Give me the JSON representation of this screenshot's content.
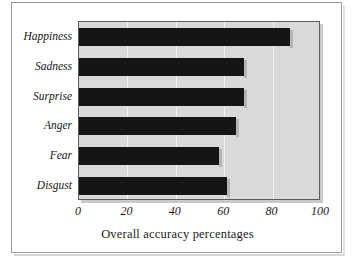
{
  "chart_data": {
    "type": "bar",
    "orientation": "horizontal",
    "title": "",
    "xlabel": "Overall accuracy percentages",
    "ylabel": "",
    "categories": [
      "Happiness",
      "Sadness",
      "Surprise",
      "Anger",
      "Fear",
      "Disgust"
    ],
    "values": [
      87,
      68,
      68,
      65,
      58,
      61
    ],
    "xlim": [
      0,
      100
    ],
    "xticks": [
      0,
      20,
      40,
      60,
      80,
      100
    ],
    "xtick_labels": [
      "0",
      "20",
      "40",
      "60",
      "80",
      "100"
    ],
    "grid": "vertical",
    "legend": "none",
    "series": [
      {
        "name": "Overall accuracy percentages",
        "values": [
          87,
          68,
          68,
          65,
          58,
          61
        ]
      }
    ],
    "colors": {
      "bar": "#151515",
      "plot_background": "#d9d9d9",
      "gridline": "#f2f2f2",
      "axis_text": "#1a1a1a",
      "plot_border": "#5c5c5c",
      "frame_border": "#9a9a9a",
      "page_background": "#ffffff"
    }
  }
}
